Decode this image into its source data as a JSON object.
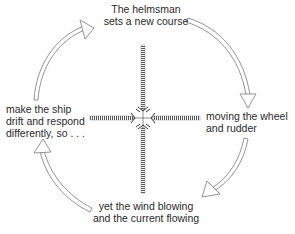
{
  "diagram": {
    "type": "feedback-cycle",
    "nodes": [
      {
        "id": "top",
        "lines": [
          "The helmsman",
          "sets a new course"
        ]
      },
      {
        "id": "right",
        "lines": [
          "moving the wheel",
          "and rudder"
        ]
      },
      {
        "id": "bottom",
        "lines": [
          "yet the wind blowing",
          "and the current flowing"
        ]
      },
      {
        "id": "left",
        "lines": [
          "make the ship",
          "drift and respond",
          "differently, so . . ."
        ]
      }
    ],
    "edges": [
      {
        "from": "top",
        "to": "right"
      },
      {
        "from": "right",
        "to": "bottom"
      },
      {
        "from": "bottom",
        "to": "left"
      },
      {
        "from": "left",
        "to": "top"
      }
    ],
    "center_graphic": "four-striped-beams-converging-cross",
    "colors": {
      "text": "#2a2a2a",
      "arrow_outline": "#8a8a8a",
      "beam": "#6a6a6a"
    }
  }
}
